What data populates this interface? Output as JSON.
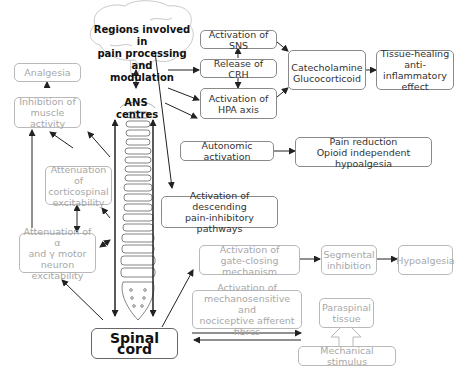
{
  "diagram": {
    "brain_label": "Regions involved in\npain processing and\nmodulation",
    "ans_label": "ANS\ncentres",
    "nodes": {
      "analgesia": "Analgesia",
      "inhibition_muscle": "Inhibition of\nmuscle activity",
      "attenuation_corticospinal": "Attenuation of\ncorticospinal\nexcitability",
      "attenuation_motor": "Attenuation of α\nand γ motor\nneuron excitability",
      "spinal_cord": "Spinal cord",
      "activation_sns": "Activation of SNS",
      "release_crh": "Release of CRH",
      "activation_hpa": "Activation of\nHPA axis",
      "catecholamine": "Catecholamine",
      "glucocorticoid": "Glucocorticoid",
      "tissue_healing": "Tissue-healing\nanti-inflammatory\neffect",
      "autonomic_activation": "Autonomic activation",
      "pain_reduction": "Pain reduction\nOpioid independent hypoalgesia",
      "descending_pathways": "Activation of descending\npain-inhibitory pathways",
      "gate_closing": "Activation of\ngate-closing mechanism",
      "segmental_inhibition": "Segmental\ninhibition",
      "hypoalgesia": "Hypoalgesia",
      "afferent_fibres": "Activation of\nmechanosensitive and\nnociceptive afferent fibres",
      "paraspinal_tissue": "Paraspinal\ntissue",
      "mechanical_stimulus": "Mechanical stimulus"
    },
    "colors": {
      "dark_border": "#8a8a8a",
      "grey_border": "#b9b9b9",
      "grey_text": "#a8a8a8",
      "arrow": "#222222"
    }
  }
}
